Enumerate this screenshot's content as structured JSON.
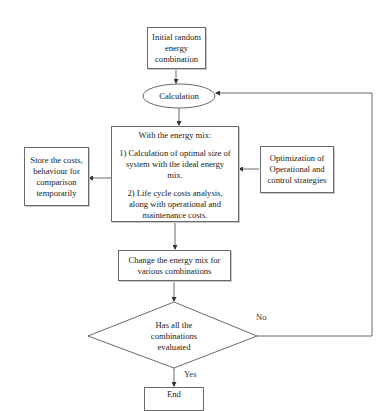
{
  "diagram": {
    "type": "flowchart",
    "colors": {
      "stroke": "#6a6a6a",
      "text": "#222222",
      "background": "#ffffff"
    },
    "nodes": {
      "start": {
        "shape": "rectangle",
        "lines": [
          "Initial random",
          "energy",
          "combination"
        ]
      },
      "calculation": {
        "shape": "ellipse",
        "label": "Calculation"
      },
      "process": {
        "shape": "rectangle",
        "heading": "With the energy mix:",
        "item1_lines": [
          "1) Calculation of optimal size of",
          "system with the ideal energy",
          "mix."
        ],
        "item2_lines": [
          "2) Life cycle costs analysis,",
          "along with operational and",
          "maintenance costs."
        ]
      },
      "store": {
        "shape": "rectangle",
        "lines": [
          "Store the costs,",
          "behaviour for",
          "comparison",
          "temporarily"
        ]
      },
      "optimization": {
        "shape": "rectangle",
        "lines": [
          "Optimization of",
          "Operational and",
          "control strategies"
        ]
      },
      "change": {
        "shape": "rectangle",
        "lines": [
          "Change the energy mix for",
          "various combinations"
        ]
      },
      "decision": {
        "shape": "diamond",
        "lines": [
          "Has all the",
          "combinations",
          "evaluated"
        ]
      },
      "end": {
        "shape": "rectangle",
        "label": "End"
      }
    },
    "edges": [
      {
        "from": "start",
        "to": "calculation"
      },
      {
        "from": "calculation",
        "to": "process"
      },
      {
        "from": "optimization",
        "to": "process"
      },
      {
        "from": "process",
        "to": "store"
      },
      {
        "from": "process",
        "to": "change"
      },
      {
        "from": "change",
        "to": "decision"
      },
      {
        "from": "decision",
        "to": "end",
        "label": "Yes"
      },
      {
        "from": "decision",
        "to": "calculation",
        "label": "No"
      }
    ],
    "edge_labels": {
      "yes": "Yes",
      "no": "No"
    }
  }
}
